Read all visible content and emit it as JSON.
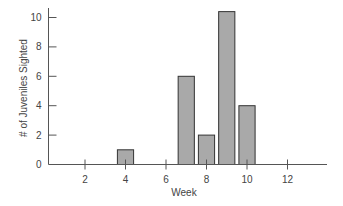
{
  "chart_data": {
    "type": "bar",
    "title": "",
    "xlabel": "Week",
    "ylabel": "# of Juveniles Sighted",
    "categories": [
      4,
      7,
      8,
      9,
      10
    ],
    "values": [
      1,
      6,
      2,
      10.4,
      4
    ],
    "x_ticks": [
      2,
      4,
      6,
      8,
      10,
      12
    ],
    "y_ticks": [
      0,
      2,
      4,
      6,
      8,
      10
    ],
    "xlim": [
      -0.1,
      13.1
    ],
    "ylim": [
      0,
      10.8
    ],
    "grid": false,
    "legend": null,
    "bar_width_weeks": 0.8
  },
  "colors": {
    "bar_fill": "#a9a9a9",
    "bar_stroke": "#333333",
    "axis": "#555555",
    "text": "#444444"
  }
}
